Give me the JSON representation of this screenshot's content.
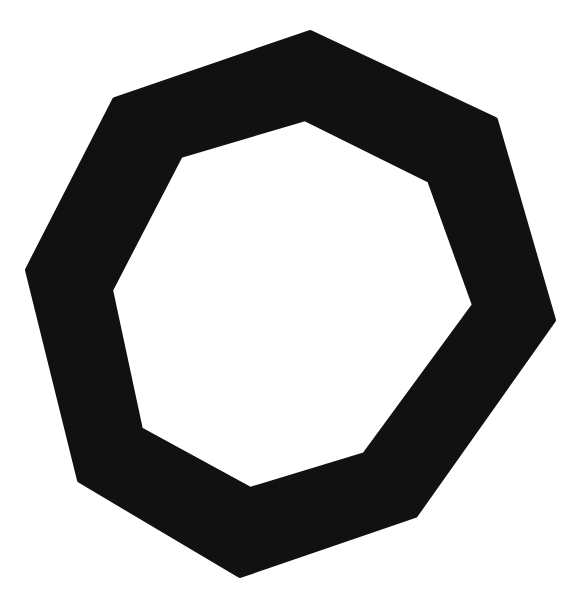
{
  "image": {
    "width": 580,
    "height": 608,
    "background": "#ffffff"
  },
  "shape": {
    "type": "octagon-ring",
    "fill": "#111111",
    "outer_points": "310,33 495,120 553,320 415,515 240,575 80,480 28,270 115,100",
    "inner_points": "305,118 430,180 475,305 365,455 250,490 140,430 110,290 180,155"
  }
}
